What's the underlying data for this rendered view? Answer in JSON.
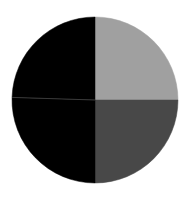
{
  "chart_data": {
    "type": "pie",
    "title": "",
    "legend": [],
    "labels": [
      "",
      "",
      "",
      ""
    ],
    "values": [
      25,
      25,
      25.5,
      24.5
    ],
    "colors": [
      "#a0a0a0",
      "#484848",
      "#000000",
      "#000000"
    ],
    "separator_color": "#3a3a3a",
    "start_angle_deg": 0,
    "direction": "clockwise"
  },
  "geometry": {
    "cx": 95,
    "cy": 100,
    "r": 83
  }
}
